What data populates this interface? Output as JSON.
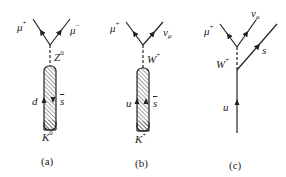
{
  "figure": {
    "panels": [
      {
        "id": "a",
        "caption": "(a)",
        "lepton_left": {
          "symbol": "μ",
          "sup": "+"
        },
        "lepton_right": {
          "symbol": "μ",
          "sup": "−"
        },
        "boson": {
          "symbol": "Z",
          "sup": "0"
        },
        "quark_left": "d",
        "quark_right": "s",
        "meson": {
          "symbol": "K",
          "sup": "0"
        }
      },
      {
        "id": "b",
        "caption": "(b)",
        "lepton_left": {
          "symbol": "μ",
          "sup": "+"
        },
        "lepton_right": {
          "symbol": "ν",
          "sub": "μ"
        },
        "boson": {
          "symbol": "W",
          "sup": "+"
        },
        "quark_left": "u",
        "quark_right": "s",
        "meson": {
          "symbol": "K",
          "sup": "+"
        }
      },
      {
        "id": "c",
        "caption": "(c)",
        "lepton_left": {
          "symbol": "μ",
          "sup": "+"
        },
        "lepton_right": {
          "symbol": "ν",
          "sub": "μ"
        },
        "boson": {
          "symbol": "W",
          "sup": "+"
        },
        "quark_in": "u",
        "quark_out": "s"
      }
    ],
    "colors": {
      "line": "#222222",
      "hatch": "#333333",
      "background": "#ffffff"
    }
  }
}
